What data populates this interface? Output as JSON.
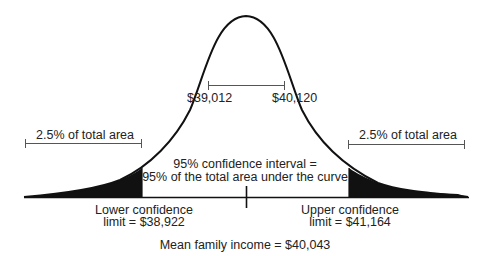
{
  "diagram": {
    "type": "normal-distribution-confidence-interval",
    "labels": {
      "inner_left": "$39,012",
      "inner_right": "$40,120",
      "tail_left": "2.5% of total area",
      "tail_right": "2.5% of total area",
      "interval_line1": "95% confidence interval =",
      "interval_line2": "95% of the total area under the curve",
      "lower_line1": "Lower confidence",
      "lower_line2": "limit = $38,922",
      "upper_line1": "Upper confidence",
      "upper_line2": "limit = $41,164",
      "mean": "Mean family income = $40,043"
    },
    "values": {
      "mean": 40043,
      "lower_limit": 38922,
      "upper_limit": 41164,
      "inner_low": 39012,
      "inner_high": 40120,
      "confidence_pct": 95,
      "tail_pct": 2.5
    },
    "colors": {
      "ink": "#111111",
      "text": "#222222",
      "bracket": "#555555",
      "background": "#ffffff"
    }
  }
}
